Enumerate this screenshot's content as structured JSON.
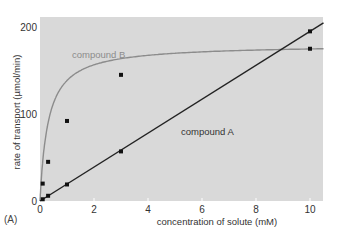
{
  "chart_data": {
    "type": "line",
    "title": "",
    "panel_label": "(A)",
    "xlabel": "concentration of solute (mM)",
    "ylabel": "rate of transport (µmol/min)",
    "xlim": [
      0,
      10.5
    ],
    "ylim": [
      0,
      210
    ],
    "xticks": [
      0,
      2,
      4,
      6,
      8,
      10
    ],
    "yticks": [
      0,
      100,
      200
    ],
    "grid": false,
    "background": "#d9d9d9",
    "series": [
      {
        "name": "compound B",
        "color": "#8c8c8c",
        "label_color": "#8c8c8c",
        "curve": "saturating (Michaelis-Menten-like)",
        "points": [
          [
            0.1,
            20
          ],
          [
            0.3,
            45
          ],
          [
            1,
            92
          ],
          [
            3,
            145
          ],
          [
            10,
            175
          ]
        ]
      },
      {
        "name": "compound A",
        "color": "#222222",
        "label_color": "#333333",
        "curve": "linear",
        "points": [
          [
            0.1,
            2
          ],
          [
            0.3,
            6
          ],
          [
            1,
            19
          ],
          [
            3,
            57
          ],
          [
            10,
            195
          ]
        ]
      }
    ],
    "annotations": [
      "compound B",
      "compound A"
    ]
  }
}
